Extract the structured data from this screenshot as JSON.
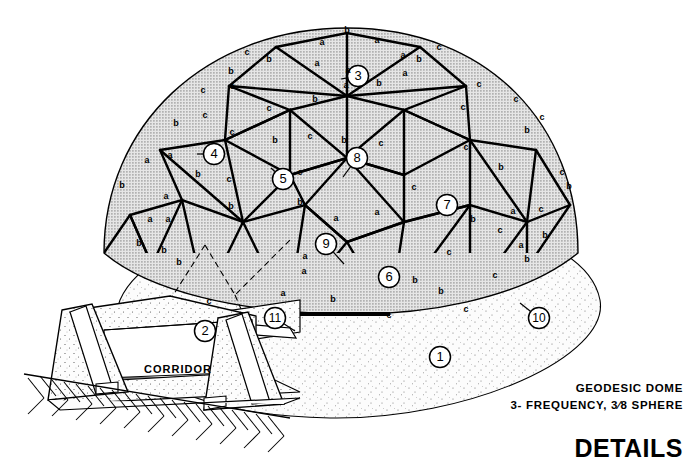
{
  "drawing": {
    "title": "DETAILS",
    "caption_line1": "GEODESIC DOME",
    "caption_line2": "3- FREQUENCY, 3⁄8 SPHERE",
    "corridor_label": "CORRIDOR"
  },
  "colors": {
    "ink": "#000000",
    "panel_fill": "#d9d9d9",
    "ground_fill": "#fbfbfb",
    "stipple": "#8a8a8a",
    "paper": "#ffffff"
  },
  "callouts": [
    {
      "id": "1",
      "cx": 440,
      "cy": 357,
      "lx": 440,
      "ly": 357
    },
    {
      "id": "2",
      "cx": 205,
      "cy": 331,
      "lx": 205,
      "ly": 331
    },
    {
      "id": "3",
      "cx": 358,
      "cy": 76,
      "lx": 341,
      "ly": 79
    },
    {
      "id": "4",
      "cx": 214,
      "cy": 154,
      "lx": 197,
      "ly": 154
    },
    {
      "id": "5",
      "cx": 283,
      "cy": 179,
      "lx": 271,
      "ly": 168
    },
    {
      "id": "6",
      "cx": 389,
      "cy": 277,
      "lx": 389,
      "ly": 277
    },
    {
      "id": "7",
      "cx": 447,
      "cy": 205,
      "lx": 447,
      "ly": 205
    },
    {
      "id": "8",
      "cx": 357,
      "cy": 158,
      "lx": 343,
      "ly": 177
    },
    {
      "id": "9",
      "cx": 326,
      "cy": 244,
      "lx": 344,
      "ly": 264
    },
    {
      "id": "10",
      "cx": 539,
      "cy": 318,
      "lx": 520,
      "ly": 303
    },
    {
      "id": "11",
      "cx": 275,
      "cy": 318,
      "lx": 295,
      "ly": 331
    }
  ],
  "strut_labels": [
    {
      "t": "b",
      "x": 347,
      "y": 33
    },
    {
      "t": "c",
      "x": 247,
      "y": 55
    },
    {
      "t": "c",
      "x": 439,
      "y": 50
    },
    {
      "t": "b",
      "x": 269,
      "y": 62
    },
    {
      "t": "a",
      "x": 322,
      "y": 45
    },
    {
      "t": "a",
      "x": 377,
      "y": 43
    },
    {
      "t": "a",
      "x": 403,
      "y": 58
    },
    {
      "t": "a",
      "x": 317,
      "y": 66
    },
    {
      "t": "b",
      "x": 419,
      "y": 62
    },
    {
      "t": "c",
      "x": 203,
      "y": 93
    },
    {
      "t": "c",
      "x": 232,
      "y": 89
    },
    {
      "t": "b",
      "x": 231,
      "y": 74
    },
    {
      "t": "a",
      "x": 348,
      "y": 73
    },
    {
      "t": "c",
      "x": 479,
      "y": 87
    },
    {
      "t": "c",
      "x": 516,
      "y": 102
    },
    {
      "t": "a",
      "x": 405,
      "y": 76
    },
    {
      "t": "b",
      "x": 379,
      "y": 86
    },
    {
      "t": "c",
      "x": 463,
      "y": 110
    },
    {
      "t": "b",
      "x": 176,
      "y": 126
    },
    {
      "t": "c",
      "x": 205,
      "y": 118
    },
    {
      "t": "c",
      "x": 269,
      "y": 111
    },
    {
      "t": "b",
      "x": 315,
      "y": 102
    },
    {
      "t": "a",
      "x": 346,
      "y": 88
    },
    {
      "t": "c",
      "x": 542,
      "y": 120
    },
    {
      "t": "b",
      "x": 527,
      "y": 133
    },
    {
      "t": "c",
      "x": 232,
      "y": 135
    },
    {
      "t": "b",
      "x": 275,
      "y": 143
    },
    {
      "t": "c",
      "x": 310,
      "y": 139
    },
    {
      "t": "b",
      "x": 344,
      "y": 143
    },
    {
      "t": "c",
      "x": 381,
      "y": 146
    },
    {
      "t": "c",
      "x": 466,
      "y": 150
    },
    {
      "t": "b",
      "x": 122,
      "y": 188
    },
    {
      "t": "a",
      "x": 147,
      "y": 163
    },
    {
      "t": "a",
      "x": 170,
      "y": 158
    },
    {
      "t": "b",
      "x": 198,
      "y": 177
    },
    {
      "t": "c",
      "x": 229,
      "y": 182
    },
    {
      "t": "c",
      "x": 300,
      "y": 175
    },
    {
      "t": "c",
      "x": 414,
      "y": 190
    },
    {
      "t": "b",
      "x": 501,
      "y": 170
    },
    {
      "t": "c",
      "x": 562,
      "y": 175
    },
    {
      "t": "b",
      "x": 569,
      "y": 189
    },
    {
      "t": "a",
      "x": 166,
      "y": 199
    },
    {
      "t": "a",
      "x": 150,
      "y": 222
    },
    {
      "t": "a",
      "x": 168,
      "y": 222
    },
    {
      "t": "b",
      "x": 231,
      "y": 209
    },
    {
      "t": "b",
      "x": 300,
      "y": 205
    },
    {
      "t": "b",
      "x": 139,
      "y": 246
    },
    {
      "t": "b",
      "x": 164,
      "y": 253
    },
    {
      "t": "a",
      "x": 336,
      "y": 221
    },
    {
      "t": "a",
      "x": 377,
      "y": 215
    },
    {
      "t": "b",
      "x": 473,
      "y": 222
    },
    {
      "t": "a",
      "x": 513,
      "y": 214
    },
    {
      "t": "c",
      "x": 541,
      "y": 212
    },
    {
      "t": "b",
      "x": 545,
      "y": 238
    },
    {
      "t": "a",
      "x": 521,
      "y": 248
    },
    {
      "t": "b",
      "x": 527,
      "y": 262
    },
    {
      "t": "c",
      "x": 500,
      "y": 233
    },
    {
      "t": "b",
      "x": 179,
      "y": 265
    },
    {
      "t": "a",
      "x": 305,
      "y": 259
    },
    {
      "t": "a",
      "x": 304,
      "y": 274
    },
    {
      "t": "c",
      "x": 449,
      "y": 255
    },
    {
      "t": "b",
      "x": 415,
      "y": 283
    },
    {
      "t": "c",
      "x": 495,
      "y": 278
    },
    {
      "t": "a",
      "x": 283,
      "y": 296
    },
    {
      "t": "b",
      "x": 333,
      "y": 302
    },
    {
      "t": "b",
      "x": 441,
      "y": 294
    },
    {
      "t": "c",
      "x": 466,
      "y": 312
    },
    {
      "t": "c",
      "x": 389,
      "y": 318
    },
    {
      "t": "c",
      "x": 209,
      "y": 304
    }
  ]
}
